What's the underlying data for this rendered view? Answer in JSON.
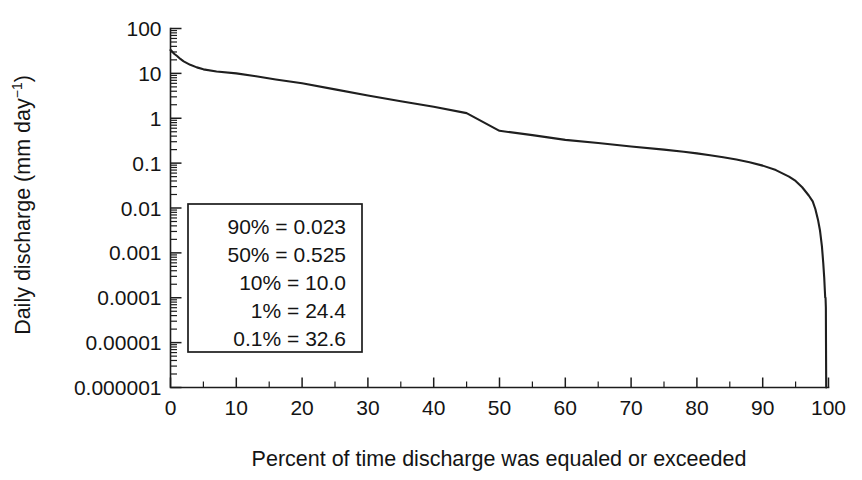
{
  "figure": {
    "background": "#ffffff",
    "ink_color": "#1c1c1c"
  },
  "chart_data": {
    "type": "line",
    "title": "",
    "subtitle": "",
    "xlabel": "Percent of time discharge was equaled or exceeded",
    "ylabel": "Daily discharge (mm day−1)",
    "ylabel_base": "Daily discharge (mm day",
    "ylabel_exponent": "−1",
    "ylabel_tail": ")",
    "xscale": "linear",
    "yscale": "log",
    "xlim": [
      0,
      100
    ],
    "ylim": [
      1e-06,
      100
    ],
    "grid": false,
    "legend_position": "inside-lower-left",
    "xticks": [
      0,
      10,
      20,
      30,
      40,
      50,
      60,
      70,
      80,
      90,
      100
    ],
    "xtick_labels": [
      "0",
      "10",
      "20",
      "30",
      "40",
      "50",
      "60",
      "70",
      "80",
      "90",
      "100"
    ],
    "xtick_minor_step": 5,
    "yticks": [
      100,
      10,
      1,
      0.1,
      0.01,
      0.001,
      0.0001,
      1e-05,
      1e-06
    ],
    "ytick_labels": [
      "100",
      "10",
      "1",
      "0.1",
      "0.01",
      "0.001",
      "0.0001",
      "0.00001",
      "0.000001"
    ],
    "series": [
      {
        "name": "Flow duration curve",
        "color": "#1f1f1f",
        "x": [
          0,
          0.1,
          0.3,
          0.6,
          1,
          1.5,
          2,
          3,
          4,
          5,
          7,
          10,
          13,
          16,
          20,
          25,
          30,
          35,
          40,
          45,
          50,
          55,
          60,
          65,
          70,
          75,
          78,
          80,
          82,
          84,
          86,
          88,
          90,
          92,
          94,
          95,
          96,
          97,
          97.6,
          98,
          98.4,
          98.7,
          99,
          99.2,
          99.35,
          99.45,
          99.5,
          99.55,
          99.6,
          99.62,
          99.65
        ],
        "y": [
          33.0,
          32.6,
          30.0,
          27.0,
          24.4,
          21.0,
          18.5,
          15.5,
          13.6,
          12.3,
          11.0,
          10.0,
          8.6,
          7.3,
          6.0,
          4.4,
          3.2,
          2.4,
          1.8,
          1.3,
          0.525,
          0.42,
          0.33,
          0.28,
          0.235,
          0.2,
          0.18,
          0.165,
          0.15,
          0.135,
          0.12,
          0.105,
          0.088,
          0.07,
          0.05,
          0.04,
          0.029,
          0.019,
          0.014,
          0.0095,
          0.0055,
          0.0032,
          0.0014,
          0.0006,
          0.00028,
          0.00014,
          0.0001,
          0.0001,
          6e-05,
          1e-05,
          1e-06
        ]
      }
    ],
    "annotations": [
      {
        "label": "90%",
        "separator": "=",
        "value": "0.023",
        "percent": 90,
        "discharge": 0.023
      },
      {
        "label": "50%",
        "separator": "=",
        "value": "0.525",
        "percent": 50,
        "discharge": 0.525
      },
      {
        "label": "10%",
        "separator": "=",
        "value": "10.0",
        "percent": 10,
        "discharge": 10.0
      },
      {
        "label": "1%",
        "separator": "=",
        "value": "24.4",
        "percent": 1,
        "discharge": 24.4
      },
      {
        "label": "0.1%",
        "separator": "=",
        "value": "32.6",
        "percent": 0.1,
        "discharge": 32.6
      }
    ]
  },
  "legend_box": {
    "lines": [
      "90% = 0.023",
      "50% = 0.525",
      "10% = 10.0",
      "1% = 24.4",
      "0.1% = 32.6"
    ]
  }
}
